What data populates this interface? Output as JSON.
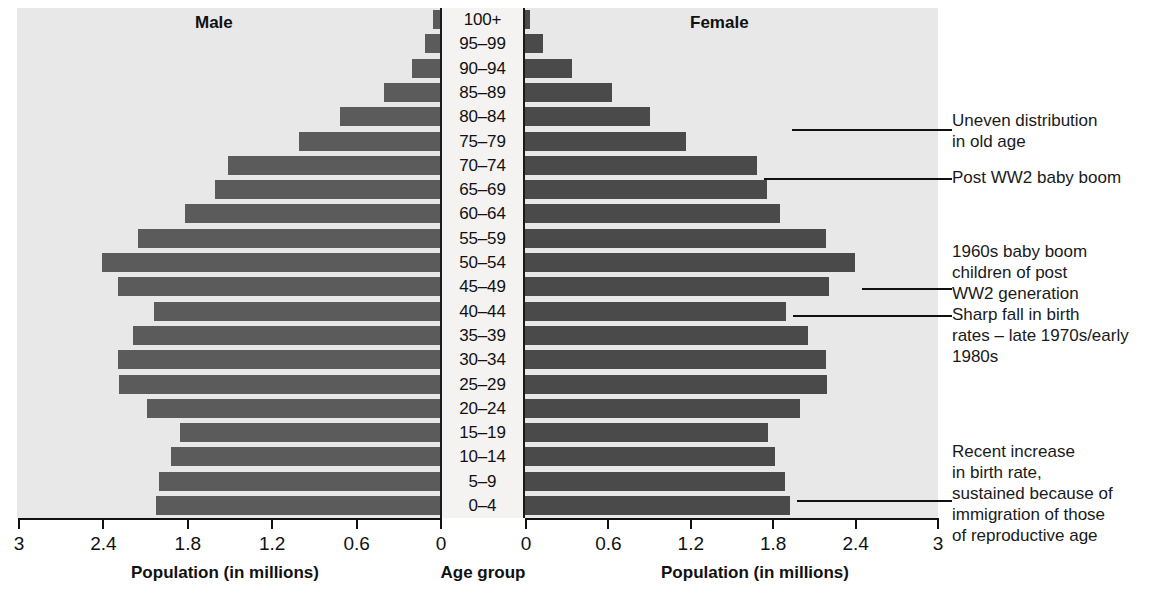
{
  "headers": {
    "male": "Male",
    "female": "Female"
  },
  "axes": {
    "left_title": "Population (in millions)",
    "center_title": "Age group",
    "right_title": "Population (in millions)",
    "left_ticks": [
      "3",
      "2.4",
      "1.8",
      "1.2",
      "0.6",
      "0"
    ],
    "right_ticks": [
      "0",
      "0.6",
      "1.2",
      "1.8",
      "2.4",
      "3"
    ]
  },
  "annotations": [
    {
      "id": "uneven-old-age",
      "text": "Uneven distribution\nin old age"
    },
    {
      "id": "post-ww2-baby-boom",
      "text": "Post WW2 baby boom"
    },
    {
      "id": "1960s-baby-boom",
      "text": "1960s baby boom\nchildren of post\nWW2 generation"
    },
    {
      "id": "sharp-fall-birth-rates",
      "text": "Sharp fall in birth\nrates – late 1970s/early\n1980s"
    },
    {
      "id": "recent-increase-birth-rate",
      "text": "Recent increase\nin birth rate,\nsustained because of\nimmigration of those\nof reproductive age"
    }
  ],
  "colors": {
    "panel": "#e8e8e8",
    "bar_male": "#5b5b5b",
    "bar_female": "#4a4a4a",
    "center_strip": "#f4f3f1",
    "ink": "#111111"
  },
  "chart_data": {
    "type": "bar",
    "xlabel": "Population (in millions)",
    "ylabel": "Age group",
    "xlim": [
      0,
      3
    ],
    "grid": false,
    "legend": [
      "Male",
      "Female"
    ],
    "orientation": "horizontal-diverging",
    "categories": [
      "100+",
      "95–99",
      "90–94",
      "85–89",
      "80–84",
      "75–79",
      "70–74",
      "65–69",
      "60–64",
      "55–59",
      "50–54",
      "45–49",
      "40–44",
      "35–39",
      "30–34",
      "25–29",
      "20–24",
      "15–19",
      "10–14",
      "5–9",
      "0–4"
    ],
    "series": [
      {
        "name": "Male",
        "values": [
          0.05,
          0.11,
          0.2,
          0.4,
          0.71,
          1.0,
          1.51,
          1.6,
          1.81,
          2.15,
          2.4,
          2.29,
          2.03,
          2.18,
          2.29,
          2.28,
          2.08,
          1.85,
          1.91,
          2.0,
          2.02
        ]
      },
      {
        "name": "Female",
        "values": [
          0.04,
          0.13,
          0.34,
          0.63,
          0.91,
          1.17,
          1.69,
          1.76,
          1.86,
          2.19,
          2.4,
          2.21,
          1.9,
          2.06,
          2.19,
          2.2,
          2.0,
          1.77,
          1.82,
          1.89,
          1.93
        ]
      }
    ]
  }
}
